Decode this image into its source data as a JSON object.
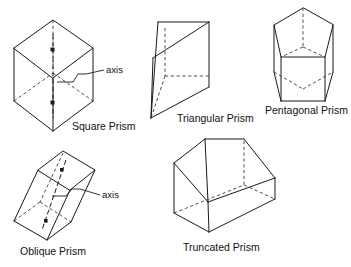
{
  "figure": {
    "background_color": "#ffffff",
    "line_color": "#1a1a1a",
    "hidden_line_color": "#3a3a3a"
  },
  "shapes": [
    {
      "id": "square-prism",
      "label": "Square Prism",
      "callout": "axis",
      "has_axis": true,
      "position": "top-left"
    },
    {
      "id": "triangular-prism",
      "label": "Triangular Prism",
      "callout": null,
      "has_axis": false,
      "position": "top-center"
    },
    {
      "id": "pentagonal-prism",
      "label": "Pentagonal Prism",
      "callout": null,
      "has_axis": false,
      "position": "top-right"
    },
    {
      "id": "oblique-prism",
      "label": "Oblique Prism",
      "callout": "axis",
      "has_axis": true,
      "position": "bottom-left"
    },
    {
      "id": "truncated-prism",
      "label": "Truncated Prism",
      "callout": null,
      "has_axis": false,
      "position": "bottom-center"
    }
  ]
}
